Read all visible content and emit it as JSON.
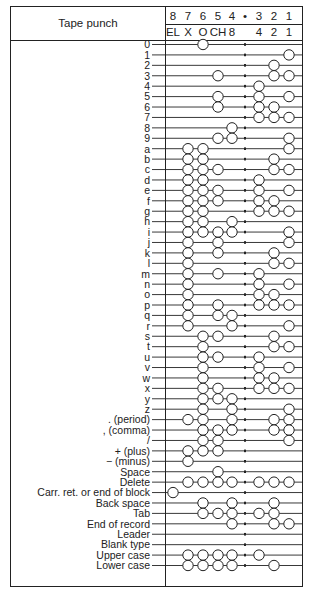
{
  "title": "Tape punch",
  "channels": {
    "numbers": [
      "8",
      "7",
      "6",
      "5",
      "4",
      "•",
      "3",
      "2",
      "1"
    ],
    "codes": [
      "EL",
      "X",
      "O",
      "CH",
      "8",
      "",
      "4",
      "2",
      "1"
    ]
  },
  "rows": [
    {
      "label": "0",
      "holes": [
        6
      ]
    },
    {
      "label": "1",
      "holes": [
        1
      ]
    },
    {
      "label": "2",
      "holes": [
        2
      ]
    },
    {
      "label": "3",
      "holes": [
        5,
        2,
        1
      ]
    },
    {
      "label": "4",
      "holes": [
        3
      ]
    },
    {
      "label": "5",
      "holes": [
        5,
        3,
        1
      ]
    },
    {
      "label": "6",
      "holes": [
        5,
        3,
        2
      ]
    },
    {
      "label": "7",
      "holes": [
        3,
        2,
        1
      ]
    },
    {
      "label": "8",
      "holes": [
        4
      ]
    },
    {
      "label": "9",
      "holes": [
        5,
        4,
        1
      ]
    },
    {
      "label": "a",
      "holes": [
        7,
        6,
        1
      ]
    },
    {
      "label": "b",
      "holes": [
        7,
        6,
        2
      ]
    },
    {
      "label": "c",
      "holes": [
        7,
        6,
        5,
        2,
        1
      ]
    },
    {
      "label": "d",
      "holes": [
        7,
        6,
        3
      ]
    },
    {
      "label": "e",
      "holes": [
        7,
        6,
        5,
        3,
        1
      ]
    },
    {
      "label": "f",
      "holes": [
        7,
        6,
        5,
        3,
        2
      ]
    },
    {
      "label": "g",
      "holes": [
        7,
        6,
        3,
        2,
        1
      ]
    },
    {
      "label": "h",
      "holes": [
        7,
        6,
        4
      ]
    },
    {
      "label": "i",
      "holes": [
        7,
        6,
        5,
        4,
        1
      ]
    },
    {
      "label": "j",
      "holes": [
        7,
        5,
        1
      ]
    },
    {
      "label": "k",
      "holes": [
        7,
        5,
        2
      ]
    },
    {
      "label": "l",
      "holes": [
        7,
        2,
        1
      ]
    },
    {
      "label": "m",
      "holes": [
        7,
        5,
        3
      ]
    },
    {
      "label": "n",
      "holes": [
        7,
        3,
        1
      ]
    },
    {
      "label": "o",
      "holes": [
        7,
        3,
        2
      ]
    },
    {
      "label": "p",
      "holes": [
        7,
        5,
        3,
        2,
        1
      ]
    },
    {
      "label": "q",
      "holes": [
        7,
        5,
        4
      ]
    },
    {
      "label": "r",
      "holes": [
        7,
        4,
        1
      ]
    },
    {
      "label": "s",
      "holes": [
        6,
        5,
        2
      ]
    },
    {
      "label": "t",
      "holes": [
        6,
        2,
        1
      ]
    },
    {
      "label": "u",
      "holes": [
        6,
        5,
        3
      ]
    },
    {
      "label": "v",
      "holes": [
        6,
        3,
        1
      ]
    },
    {
      "label": "w",
      "holes": [
        6,
        3,
        2
      ]
    },
    {
      "label": "x",
      "holes": [
        6,
        5,
        3,
        2,
        1
      ]
    },
    {
      "label": "y",
      "holes": [
        6,
        5,
        4
      ]
    },
    {
      "label": "z",
      "holes": [
        6,
        4,
        1
      ]
    },
    {
      "label": ". (period)",
      "holes": [
        7,
        6,
        4,
        2,
        1
      ]
    },
    {
      "label": ", (comma)",
      "holes": [
        6,
        5,
        4,
        2,
        1
      ]
    },
    {
      "label": "/",
      "holes": [
        6,
        5,
        1
      ]
    },
    {
      "label": "+ (plus)",
      "holes": [
        7,
        6,
        5
      ]
    },
    {
      "label": "− (minus)",
      "holes": [
        7
      ]
    },
    {
      "label": "Space",
      "holes": [
        5
      ]
    },
    {
      "label": "Delete",
      "holes": [
        7,
        6,
        5,
        4,
        3,
        2,
        1
      ]
    },
    {
      "label": "Carr. ret. or end of block",
      "holes": [
        8
      ]
    },
    {
      "label": "Back space",
      "holes": [
        6,
        4,
        2
      ]
    },
    {
      "label": "Tab",
      "holes": [
        6,
        5,
        4,
        3,
        2
      ]
    },
    {
      "label": "End of record",
      "holes": [
        4,
        2,
        1
      ]
    },
    {
      "label": "Leader",
      "holes": []
    },
    {
      "label": "Blank type",
      "holes": []
    },
    {
      "label": "Upper case",
      "holes": [
        7,
        6,
        5,
        4,
        3
      ]
    },
    {
      "label": "Lower case",
      "holes": [
        7,
        6,
        5,
        4,
        2
      ]
    }
  ],
  "colors": {
    "ink": "#222222",
    "paper": "#ffffff"
  }
}
